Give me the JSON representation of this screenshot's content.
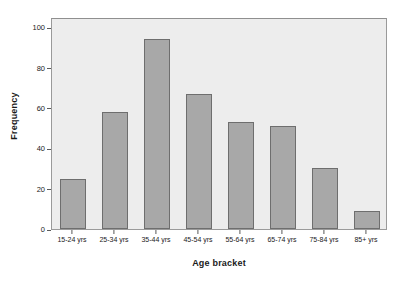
{
  "chart_data": {
    "type": "bar",
    "title": "",
    "xlabel": "Age bracket",
    "ylabel": "Frequency",
    "categories": [
      "15-24 yrs",
      "25-34 yrs",
      "35-44 yrs",
      "45-54 yrs",
      "55-64 yrs",
      "65-74 yrs",
      "75-84 yrs",
      "85+ yrs"
    ],
    "values": [
      25,
      58,
      94,
      67,
      53,
      51,
      30,
      9
    ],
    "ylim": [
      0,
      105
    ],
    "yticks": [
      0,
      20,
      40,
      60,
      80,
      100
    ],
    "ytick_labels": [
      "0",
      "20",
      "40",
      "60",
      "80",
      "100"
    ],
    "grid": false,
    "legend": false,
    "series": [
      {
        "name": "Frequency",
        "values": [
          25,
          58,
          94,
          67,
          53,
          51,
          30,
          9
        ]
      }
    ],
    "style": {
      "bar_fill": "#a8a8a8",
      "bar_border": "#6e6e6e",
      "plot_background": "#ededed",
      "figure_background": "#ffffff",
      "axis_color": "#5a5a5a",
      "text_color": "#1a1a1a"
    }
  }
}
